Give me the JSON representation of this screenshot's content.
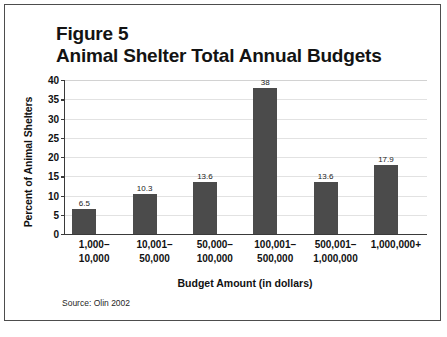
{
  "figure": {
    "title_line1": "Figure 5",
    "title_line2": "Animal Shelter Total Annual Budgets",
    "source": "Source: Olin 2002",
    "border_color": "#4d4d4d"
  },
  "chart_data": {
    "type": "bar",
    "subtitle": "Animal Shelter Total Annual Budgets",
    "xlabel": "Budget Amount (in dollars)",
    "ylabel": "Percent of Animal Shelters",
    "categories": [
      "1,000–\n10,000",
      "10,001–\n50,000",
      "50,000–\n100,000",
      "100,001–\n500,000",
      "500,001–\n1,000,000",
      "1,000,000+"
    ],
    "category_lines": [
      [
        "1,000–",
        "10,000"
      ],
      [
        "10,001–",
        "50,000"
      ],
      [
        "50,000–",
        "100,000"
      ],
      [
        "100,001–",
        "500,000"
      ],
      [
        "500,001–",
        "1,000,000"
      ],
      [
        "1,000,000+",
        ""
      ]
    ],
    "values": [
      6.5,
      10.3,
      13.6,
      38,
      13.6,
      17.9
    ],
    "value_labels": [
      "6.5",
      "10.3",
      "13.6",
      "38",
      "13.6",
      "17.9"
    ],
    "ylim": [
      0,
      40
    ],
    "yticks": [
      0,
      5,
      10,
      15,
      20,
      25,
      30,
      35,
      40
    ],
    "ytick_labels": [
      "0",
      "5",
      "10",
      "15",
      "20",
      "25",
      "30",
      "35",
      "40"
    ],
    "grid": true,
    "legend": "none",
    "bar_color": "#4b4b4b",
    "grid_color": "#e2e2e2",
    "axis_color": "#3a3a3a"
  }
}
